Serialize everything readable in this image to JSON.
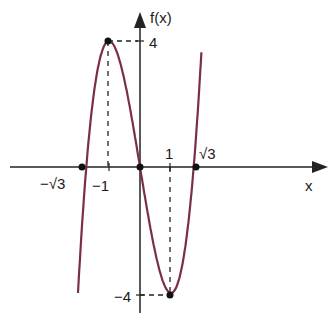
{
  "chart_data": {
    "type": "line",
    "title": "",
    "function": "f(x) = x^3 - 3x + 2 shifted; graph shows f(x) = -... cubic with local max (-1, 4) and local min (1, -4)",
    "xlabel": "x",
    "ylabel": "f(x)",
    "x_tick_labels": [
      "-√3",
      "-1",
      "1",
      "√3"
    ],
    "y_tick_labels": [
      "4",
      "-4"
    ],
    "key_points": [
      {
        "x": -1.732,
        "y": 0,
        "label": "-√3"
      },
      {
        "x": -1,
        "y": 4,
        "label": "local maximum"
      },
      {
        "x": 0,
        "y": 0,
        "label": "origin root"
      },
      {
        "x": 1,
        "y": -4,
        "label": "local minimum"
      },
      {
        "x": 1.732,
        "y": 0,
        "label": "√3"
      }
    ],
    "series": [
      {
        "name": "f(x)",
        "color": "#7a2d4f",
        "x": [
          -2.05,
          -1.732,
          -1.5,
          -1,
          -0.5,
          0,
          0.5,
          1,
          1.5,
          1.732,
          2.2
        ],
        "y": [
          -5.52,
          0,
          3.0,
          4,
          2.75,
          0,
          -2.75,
          -4,
          -3.0,
          0,
          6.8
        ]
      }
    ],
    "grid": false,
    "legend": null
  },
  "labels": {
    "y_axis": "f(x)",
    "x_axis": "x",
    "y_max": "4",
    "y_min": "−4",
    "x_neg_sqrt3": "−√3",
    "x_neg1": "−1",
    "x_1": "1",
    "x_sqrt3": "√3"
  }
}
